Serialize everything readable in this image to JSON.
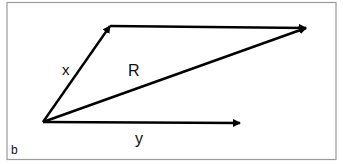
{
  "panel_label": "b",
  "vectors": [
    {
      "name": "x",
      "label": "x",
      "from": [
        43,
        122
      ],
      "to": [
        110,
        26
      ]
    },
    {
      "name": "R",
      "label": "R",
      "from": [
        43,
        122
      ],
      "to": [
        306,
        28
      ]
    },
    {
      "name": "y",
      "label": "y",
      "from": [
        43,
        122
      ],
      "to": [
        240,
        123
      ]
    },
    {
      "name": "top",
      "label": "",
      "from": [
        110,
        26
      ],
      "to": [
        306,
        28
      ]
    }
  ],
  "labels": {
    "x": "x",
    "R": "R",
    "y": "y"
  },
  "colors": {
    "line": "#000000",
    "frame": "#9a9a9a",
    "background": "#ffffff"
  }
}
